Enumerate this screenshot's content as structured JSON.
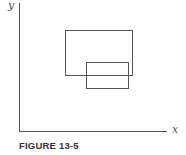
{
  "figure": {
    "caption": "FIGURE 13-5",
    "axes": {
      "x_label": "x",
      "y_label": "y",
      "origin": [
        19,
        131
      ],
      "x_end": 167,
      "y_top": 3
    },
    "rectangles": [
      {
        "name": "large-rectangle",
        "x": 65,
        "y": 30,
        "width": 67,
        "height": 45
      },
      {
        "name": "small-rectangle",
        "x": 86,
        "y": 62,
        "width": 42,
        "height": 26
      }
    ],
    "colors": {
      "line": "#555555",
      "text": "#333333",
      "background": "#ffffff"
    }
  }
}
